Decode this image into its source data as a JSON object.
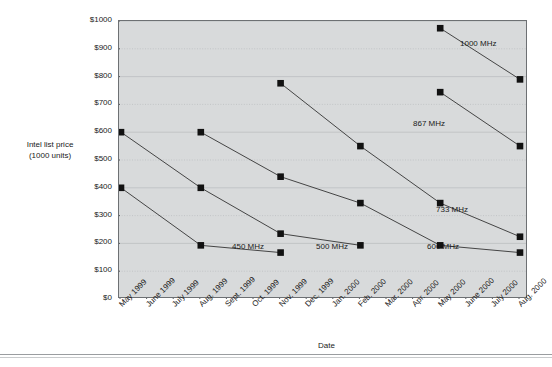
{
  "chart_data": {
    "type": "line",
    "title": "",
    "ylabel": "Intel list price\n(1000 units)",
    "ylabel_line1": "Intel list price",
    "ylabel_line2": "(1000 units)",
    "xlabel": "Date",
    "ylim": [
      0,
      1000
    ],
    "ytick_step": 100,
    "ytick_labels": [
      "$0",
      "$100",
      "$200",
      "$300",
      "$400",
      "$500",
      "$600",
      "$700",
      "$800",
      "$900",
      "$1000"
    ],
    "ytick_values": [
      0,
      100,
      200,
      300,
      400,
      500,
      600,
      700,
      800,
      900,
      1000
    ],
    "grid": true,
    "legend_position": "inline-annotations",
    "categories": [
      "May 1999",
      "June 1999",
      "July 1999",
      "Aug. 1999",
      "Sept. 1999",
      "Oct. 1999",
      "Nov. 1999",
      "Dec. 1999",
      "Jan. 2000",
      "Feb. 2000",
      "Mar. 2000",
      "Apr. 2000",
      "May 2000",
      "June 2000",
      "July 2000",
      "Aug. 2000"
    ],
    "series": [
      {
        "name": "450 MHz",
        "label": "450 MHz",
        "points": [
          {
            "x": "May 1999",
            "y": 400
          },
          {
            "x": "Aug. 1999",
            "y": 193
          },
          {
            "x": "Nov. 1999",
            "y": 167
          }
        ]
      },
      {
        "name": "500 MHz",
        "label": "500 MHz",
        "points": [
          {
            "x": "May 1999",
            "y": 600
          },
          {
            "x": "Aug. 1999",
            "y": 400
          },
          {
            "x": "Nov. 1999",
            "y": 235
          },
          {
            "x": "Feb. 2000",
            "y": 193
          }
        ]
      },
      {
        "name": "600 MHz",
        "label": "600 MHz",
        "points": [
          {
            "x": "Aug. 1999",
            "y": 600
          },
          {
            "x": "Nov. 1999",
            "y": 440
          },
          {
            "x": "Feb. 2000",
            "y": 345
          },
          {
            "x": "May 2000",
            "y": 193
          },
          {
            "x": "Aug. 2000",
            "y": 167
          }
        ]
      },
      {
        "name": "733 MHz",
        "label": "733 MHz",
        "points": [
          {
            "x": "Nov. 1999",
            "y": 776
          },
          {
            "x": "Feb. 2000",
            "y": 550
          },
          {
            "x": "May 2000",
            "y": 345
          },
          {
            "x": "Aug. 2000",
            "y": 224
          }
        ]
      },
      {
        "name": "867 MHz",
        "label": "867 MHz",
        "points": [
          {
            "x": "May 2000",
            "y": 744
          },
          {
            "x": "Aug. 2000",
            "y": 550
          }
        ]
      },
      {
        "name": "1000 MHz",
        "label": "1000 MHz",
        "points": [
          {
            "x": "May 2000",
            "y": 974
          },
          {
            "x": "Aug. 2000",
            "y": 790
          }
        ]
      }
    ],
    "series_annotations": [
      {
        "label": "450 MHz",
        "left": 232,
        "top": 243
      },
      {
        "label": "500 MHz",
        "left": 316,
        "top": 243
      },
      {
        "label": "600 MHz",
        "left": 427,
        "top": 243
      },
      {
        "label": "733 MHz",
        "left": 436,
        "top": 206
      },
      {
        "label": "867 MHz",
        "left": 413,
        "top": 120
      },
      {
        "label": "1000 MHz",
        "left": 460,
        "top": 40
      }
    ],
    "colors": {
      "plot_background": "#d8dadb",
      "marker": "#111111",
      "line": "#333333",
      "grid": "#b9bcbe",
      "axis": "#6d7073",
      "text": "#1a1a1a",
      "page_background": "#ffffff"
    }
  }
}
